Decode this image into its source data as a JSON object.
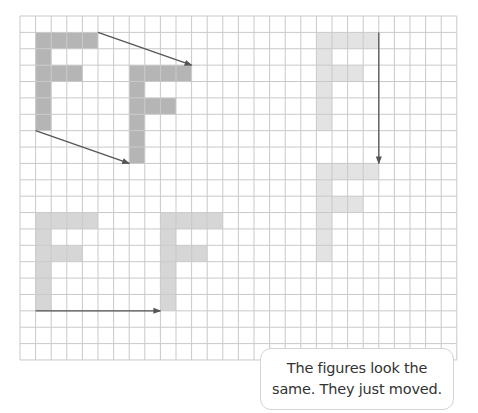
{
  "grid": {
    "left": 20,
    "top": 16,
    "cols": 28,
    "rows": 21,
    "cell_w": 15.6,
    "cell_h": 16.38,
    "line_color": "#c9c9c9"
  },
  "shape_template": {
    "name": "F",
    "cells": [
      [
        0,
        0
      ],
      [
        1,
        0
      ],
      [
        2,
        0
      ],
      [
        3,
        0
      ],
      [
        0,
        1
      ],
      [
        0,
        2
      ],
      [
        1,
        2
      ],
      [
        2,
        2
      ],
      [
        0,
        3
      ],
      [
        0,
        4
      ],
      [
        0,
        5
      ]
    ]
  },
  "figures": [
    {
      "id": "f1-original",
      "col": 1,
      "row": 1,
      "color": "#b5b5b5"
    },
    {
      "id": "f1-moved",
      "col": 7,
      "row": 3,
      "color": "#b5b5b5"
    },
    {
      "id": "f2-original",
      "col": 19,
      "row": 1,
      "color": "#e3e3e3"
    },
    {
      "id": "f2-moved",
      "col": 19,
      "row": 9,
      "color": "#e3e3e3"
    },
    {
      "id": "f3-original",
      "col": 1,
      "row": 12,
      "color": "#d6d6d6"
    },
    {
      "id": "f3-moved",
      "col": 9,
      "row": 12,
      "color": "#d6d6d6"
    }
  ],
  "arrows": [
    {
      "id": "arrow-f1-top",
      "from": [
        5,
        1
      ],
      "to": [
        11,
        3
      ]
    },
    {
      "id": "arrow-f1-bottom",
      "from": [
        1,
        7
      ],
      "to": [
        7,
        9
      ]
    },
    {
      "id": "arrow-f2",
      "from": [
        23,
        1
      ],
      "to": [
        23,
        9
      ]
    },
    {
      "id": "arrow-f3",
      "from": [
        1,
        18
      ],
      "to": [
        9,
        18
      ]
    }
  ],
  "arrow_color": "#555555",
  "bubble": {
    "line1": "The figures look the",
    "line2": "same. They just moved."
  }
}
